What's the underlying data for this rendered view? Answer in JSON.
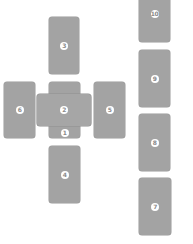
{
  "diagram": {
    "type": "tarot-spread",
    "layout": "celtic-cross",
    "card_color": "#a3a3a3",
    "label_color": "#ffffff",
    "cards": [
      {
        "id": 1,
        "label": "1",
        "orientation": "vertical",
        "x": 49,
        "y": 82,
        "w": 31,
        "h": 56
      },
      {
        "id": 2,
        "label": "2",
        "orientation": "horizontal",
        "x": 37,
        "y": 94,
        "w": 54,
        "h": 32
      },
      {
        "id": 3,
        "label": "3",
        "orientation": "vertical",
        "x": 49,
        "y": 17,
        "w": 30,
        "h": 57
      },
      {
        "id": 4,
        "label": "4",
        "orientation": "vertical",
        "x": 49,
        "y": 146,
        "w": 31,
        "h": 57
      },
      {
        "id": 5,
        "label": "5",
        "orientation": "vertical",
        "x": 94,
        "y": 82,
        "w": 31,
        "h": 56
      },
      {
        "id": 6,
        "label": "6",
        "orientation": "vertical",
        "x": 4,
        "y": 82,
        "w": 31,
        "h": 56
      },
      {
        "id": 7,
        "label": "7",
        "orientation": "vertical",
        "x": 139,
        "y": 178,
        "w": 32,
        "h": 57
      },
      {
        "id": 8,
        "label": "8",
        "orientation": "vertical",
        "x": 139,
        "y": 114,
        "w": 31,
        "h": 57
      },
      {
        "id": 9,
        "label": "9",
        "orientation": "vertical",
        "x": 139,
        "y": 50,
        "w": 31,
        "h": 57
      },
      {
        "id": 10,
        "label": "10",
        "orientation": "vertical",
        "x": 139,
        "y": 0,
        "w": 31,
        "h": 42
      }
    ]
  }
}
